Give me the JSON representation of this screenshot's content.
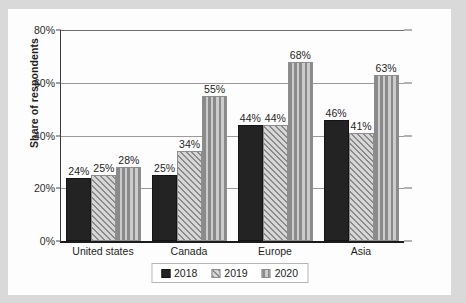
{
  "chart_data": {
    "type": "bar",
    "title": "",
    "xlabel": "",
    "ylabel": "Share of respondents",
    "categories": [
      "United states",
      "Canada",
      "Europe",
      "Asia"
    ],
    "series": [
      {
        "name": "2018",
        "values": [
          24,
          25,
          44,
          46
        ],
        "pattern": "solid",
        "color": "#232323"
      },
      {
        "name": "2019",
        "values": [
          25,
          34,
          44,
          41
        ],
        "pattern": "diagonal-hatch",
        "color": "#c4c4c4"
      },
      {
        "name": "2020",
        "values": [
          28,
          55,
          68,
          63
        ],
        "pattern": "vertical-stripes",
        "color": "#c8c8c8"
      }
    ],
    "value_labels": [
      [
        "24%",
        "25%",
        "28%"
      ],
      [
        "25%",
        "34%",
        "55%"
      ],
      [
        "44%",
        "44%",
        "68%"
      ],
      [
        "46%",
        "41%",
        "63%"
      ]
    ],
    "ylim": [
      0,
      80
    ],
    "yticks": [
      0,
      20,
      40,
      60,
      80
    ],
    "ytick_labels": [
      "0%",
      "20%",
      "40%",
      "60%",
      "80%"
    ],
    "grid": true,
    "legend_position": "bottom"
  },
  "axis": {
    "y_title": "Share of respondents",
    "y_ticks": [
      {
        "label": "80%",
        "value": 80
      },
      {
        "label": "60%",
        "value": 60
      },
      {
        "label": "40%",
        "value": 40
      },
      {
        "label": "20%",
        "value": 20
      },
      {
        "label": "0%",
        "value": 0
      }
    ],
    "x_categories": [
      "United states",
      "Canada",
      "Europe",
      "Asia"
    ]
  },
  "legend": {
    "items": [
      {
        "label": "2018",
        "swatch": "solid-black-swatch"
      },
      {
        "label": "2019",
        "swatch": "diagonal-hatch-swatch"
      },
      {
        "label": "2020",
        "swatch": "vertical-stripe-swatch"
      }
    ]
  },
  "groups": [
    {
      "category": "United states",
      "bars": [
        {
          "series": "2018",
          "value": 24,
          "label": "24%"
        },
        {
          "series": "2019",
          "value": 25,
          "label": "25%"
        },
        {
          "series": "2020",
          "value": 28,
          "label": "28%"
        }
      ]
    },
    {
      "category": "Canada",
      "bars": [
        {
          "series": "2018",
          "value": 25,
          "label": "25%"
        },
        {
          "series": "2019",
          "value": 34,
          "label": "34%"
        },
        {
          "series": "2020",
          "value": 55,
          "label": "55%"
        }
      ]
    },
    {
      "category": "Europe",
      "bars": [
        {
          "series": "2018",
          "value": 44,
          "label": "44%"
        },
        {
          "series": "2019",
          "value": 44,
          "label": "44%"
        },
        {
          "series": "2020",
          "value": 68,
          "label": "68%"
        }
      ]
    },
    {
      "category": "Asia",
      "bars": [
        {
          "series": "2018",
          "value": 46,
          "label": "46%"
        },
        {
          "series": "2019",
          "value": 41,
          "label": "41%"
        },
        {
          "series": "2020",
          "value": 63,
          "label": "63%"
        }
      ]
    }
  ],
  "colors": {
    "series_2018": "#232323",
    "series_2019": "#c4c4c4",
    "series_2020": "#c8c8c8",
    "gridline": "#9a9a9a",
    "axis": "#1c1c1c",
    "card_background": "#fdfdfd",
    "page_background": "#d9d9d9"
  }
}
